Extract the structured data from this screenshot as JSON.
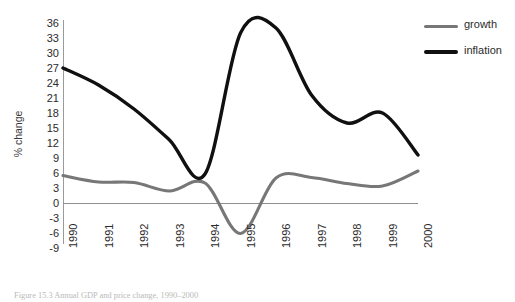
{
  "chart_data": {
    "type": "line",
    "title": "",
    "xlabel": "",
    "ylabel": "% change",
    "x": [
      1990,
      1991,
      1992,
      1993,
      1994,
      1995,
      1996,
      1997,
      1998,
      1999,
      2000
    ],
    "xticklabels": [
      "1990",
      "1991",
      "1992",
      "1993",
      "1994",
      "1995",
      "1996",
      "1997",
      "1998",
      "1999",
      "2000"
    ],
    "yticklabels": [
      "36",
      "33",
      "30",
      "27",
      "24",
      "21",
      "18",
      "15",
      "12",
      "9",
      "6",
      "3",
      "0",
      "-3",
      "-6",
      "-9"
    ],
    "yticks": [
      36,
      33,
      30,
      27,
      24,
      21,
      18,
      15,
      12,
      9,
      6,
      3,
      0,
      -3,
      -6,
      -9
    ],
    "ylim": [
      -9,
      36
    ],
    "xlim": [
      1990,
      2000
    ],
    "grid": false,
    "zero_line": true,
    "legend_position": "right",
    "series": [
      {
        "name": "growth",
        "color": "#777777",
        "values": [
          5.5,
          4.2,
          4.1,
          2.4,
          4.0,
          -6.1,
          5.0,
          5.1,
          3.9,
          3.4,
          6.4
        ]
      },
      {
        "name": "inflation",
        "color": "#101010",
        "values": [
          27.0,
          23.6,
          18.8,
          12.6,
          5.8,
          34.0,
          35.0,
          21.6,
          16.0,
          18.0,
          9.6
        ]
      }
    ],
    "annotations": {
      "inflation_peak_value": 36,
      "inflation_peak_x": 1995.7,
      "inflation_trough_value": 5.8,
      "inflation_trough_x": 1994.1,
      "growth_trough_value": -6.1,
      "growth_trough_x": 1995.1
    }
  },
  "legend": {
    "items": [
      {
        "label": "growth",
        "swatch": "growth-line-swatch"
      },
      {
        "label": "inflation",
        "swatch": "inflation-line-swatch"
      }
    ]
  },
  "caption": {
    "text": "Figure 15.3  Annual GDP and price change, 1990–2000"
  }
}
